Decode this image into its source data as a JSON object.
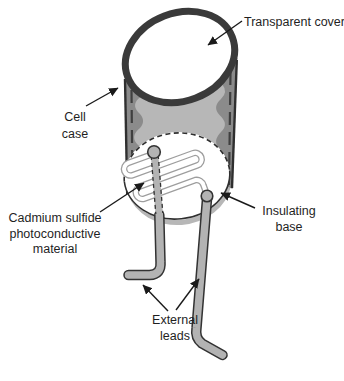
{
  "labels": {
    "transparent_cover": "Transparent cover",
    "cell_case": "Cell\ncase",
    "photoconductive_material": "Cadmium sulfide\nphotoconductive\nmaterial",
    "insulating_base": "Insulating\nbase",
    "external_leads": "External\nleads"
  },
  "colors": {
    "background": "#ffffff",
    "case_inner_shade": "#b7b7b7",
    "case_side_shade": "#8b8b8b",
    "cover_rim": "#3a3a3a",
    "lead_fill": "#b3b3b3",
    "outline": "#2f2f2f",
    "serpentine_outline": "#9e9e9e",
    "label_text": "#1f1f1f",
    "leader_line": "#1a1a1a"
  }
}
